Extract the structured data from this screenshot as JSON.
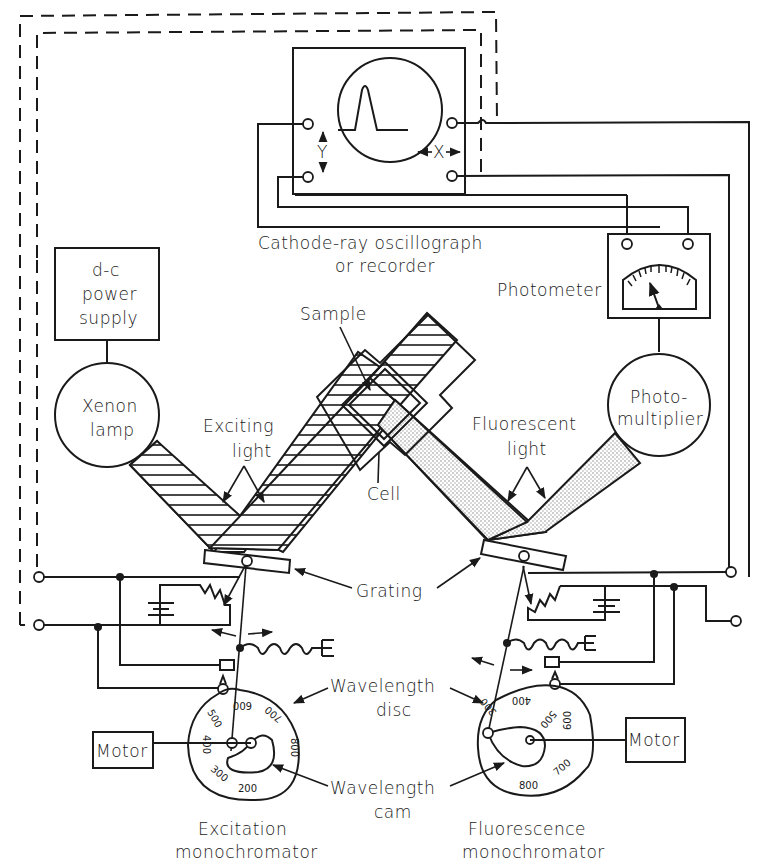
{
  "diagram": {
    "labels": {
      "oscillograph_line1": "Cathode-ray oscillograph",
      "oscillograph_line2": "or recorder",
      "axis_y": "Y",
      "axis_x": "X",
      "power_supply_line1": "d-c",
      "power_supply_line2": "power",
      "power_supply_line3": "supply",
      "photometer": "Photometer",
      "sample": "Sample",
      "cell": "Cell",
      "xenon_line1": "Xenon",
      "xenon_line2": "lamp",
      "photomultiplier_line1": "Photo-",
      "photomultiplier_line2": "multiplier",
      "exciting_line1": "Exciting",
      "exciting_line2": "light",
      "fluorescent_line1": "Fluorescent",
      "fluorescent_line2": "light",
      "grating": "Grating",
      "wavelength_disc_line1": "Wavelength",
      "wavelength_disc_line2": "disc",
      "wavelength_cam_line1": "Wavelength",
      "wavelength_cam_line2": "cam",
      "motor_left": "Motor",
      "motor_right": "Motor",
      "excitation_line1": "Excitation",
      "excitation_line2": "monochromator",
      "fluorescence_line1": "Fluorescence",
      "fluorescence_line2": "monochromator"
    },
    "excitation_disc_scale": [
      "200",
      "300",
      "400",
      "500",
      "600",
      "700",
      "800"
    ],
    "fluorescence_disc_scale": [
      "300",
      "400",
      "500",
      "600",
      "700",
      "800"
    ],
    "colors": {
      "ink": "#1a1a1a",
      "background": "#ffffff"
    }
  }
}
